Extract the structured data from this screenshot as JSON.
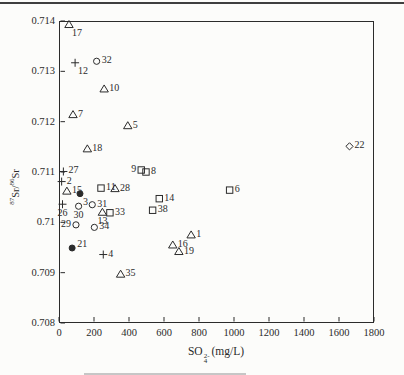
{
  "page": {
    "colors": {
      "ink": "#2b2b2b",
      "paper": "#fcfcfa",
      "top_rule": "#3f3f3f",
      "caption_fragment": "#c6c6c6"
    }
  },
  "chart_data": {
    "type": "scatter",
    "title": "",
    "xlabel_parts": {
      "base": "SO",
      "sup": "2-",
      "sub": "4",
      "suffix": "(mg/L)"
    },
    "ylabel_parts": {
      "sup1": "87",
      "base1": "Sr/",
      "sup2": "86",
      "base2": "Sr"
    },
    "xlim": [
      0,
      1800
    ],
    "ylim": [
      0.708,
      0.714
    ],
    "grid": false,
    "legend": "none",
    "tick_style": "inside",
    "x_ticks": [
      {
        "value": 0,
        "label": "0"
      },
      {
        "value": 200,
        "label": "200"
      },
      {
        "value": 400,
        "label": "400"
      },
      {
        "value": 600,
        "label": "600"
      },
      {
        "value": 800,
        "label": "800"
      },
      {
        "value": 1000,
        "label": "1000"
      },
      {
        "value": 1200,
        "label": "1200"
      },
      {
        "value": 1400,
        "label": "1400"
      },
      {
        "value": 1600,
        "label": "1600"
      },
      {
        "value": 1800,
        "label": "1800"
      }
    ],
    "y_ticks": [
      {
        "value": 0.714,
        "label": "0.714"
      },
      {
        "value": 0.713,
        "label": "0.713"
      },
      {
        "value": 0.712,
        "label": "0.712"
      },
      {
        "value": 0.711,
        "label": "0.711"
      },
      {
        "value": 0.71,
        "label": "0.71"
      },
      {
        "value": 0.709,
        "label": "0.709"
      },
      {
        "value": 0.708,
        "label": "0.708"
      }
    ],
    "series": [
      {
        "name": "samples",
        "points": [
          {
            "id": "17",
            "marker": "triangle",
            "x": 57,
            "y": 0.71393,
            "label_pos": "below-right"
          },
          {
            "id": "12",
            "marker": "plus",
            "x": 92,
            "y": 0.71317,
            "label_pos": "below-right"
          },
          {
            "id": "32",
            "marker": "circle",
            "x": 215,
            "y": 0.7132,
            "label_pos": "right"
          },
          {
            "id": "10",
            "marker": "triangle",
            "x": 258,
            "y": 0.71265,
            "label_pos": "right"
          },
          {
            "id": "7",
            "marker": "triangle",
            "x": 80,
            "y": 0.71214,
            "label_pos": "right"
          },
          {
            "id": "5",
            "marker": "triangle",
            "x": 393,
            "y": 0.71192,
            "label_pos": "right"
          },
          {
            "id": "18",
            "marker": "triangle",
            "x": 162,
            "y": 0.71146,
            "label_pos": "right"
          },
          {
            "id": "22",
            "marker": "diamond",
            "x": 1660,
            "y": 0.71151,
            "label_pos": "right"
          },
          {
            "id": "9",
            "marker": "square",
            "x": 470,
            "y": 0.71104,
            "label_pos": "left"
          },
          {
            "id": "8",
            "marker": "square",
            "x": 497,
            "y": 0.711,
            "label_pos": "right"
          },
          {
            "id": "27",
            "marker": "plus",
            "x": 25,
            "y": 0.71101,
            "label_pos": "right"
          },
          {
            "id": "2",
            "marker": "plus",
            "x": 15,
            "y": 0.71081,
            "label_pos": "right"
          },
          {
            "id": "15",
            "marker": "triangle",
            "x": 45,
            "y": 0.71062,
            "label_pos": "right"
          },
          {
            "id": "3",
            "marker": "filled-circle",
            "x": 120,
            "y": 0.71057,
            "label_pos": "below-right"
          },
          {
            "id": "11",
            "marker": "square",
            "x": 240,
            "y": 0.71068,
            "label_pos": "right"
          },
          {
            "id": "28",
            "marker": "triangle",
            "x": 320,
            "y": 0.71067,
            "label_pos": "right"
          },
          {
            "id": "14",
            "marker": "square",
            "x": 573,
            "y": 0.71047,
            "label_pos": "right"
          },
          {
            "id": "6",
            "marker": "square",
            "x": 975,
            "y": 0.71064,
            "label_pos": "right"
          },
          {
            "id": "26",
            "marker": "plus",
            "x": 20,
            "y": 0.71036,
            "label_pos": "below"
          },
          {
            "id": "30",
            "marker": "circle",
            "x": 112,
            "y": 0.71032,
            "label_pos": "below"
          },
          {
            "id": "31",
            "marker": "circle",
            "x": 190,
            "y": 0.71035,
            "label_pos": "right"
          },
          {
            "id": "13",
            "marker": "triangle",
            "x": 248,
            "y": 0.7102,
            "label_pos": "below"
          },
          {
            "id": "33",
            "marker": "square",
            "x": 291,
            "y": 0.71019,
            "label_pos": "right"
          },
          {
            "id": "38",
            "marker": "square",
            "x": 535,
            "y": 0.71024,
            "label_pos": "right"
          },
          {
            "id": "29",
            "marker": "circle",
            "x": 97,
            "y": 0.70995,
            "label_pos": "left"
          },
          {
            "id": "34",
            "marker": "circle",
            "x": 202,
            "y": 0.7099,
            "label_pos": "right"
          },
          {
            "id": "1",
            "marker": "triangle",
            "x": 755,
            "y": 0.70975,
            "label_pos": "right"
          },
          {
            "id": "16",
            "marker": "triangle",
            "x": 650,
            "y": 0.70955,
            "label_pos": "right"
          },
          {
            "id": "19",
            "marker": "triangle",
            "x": 685,
            "y": 0.70942,
            "label_pos": "right"
          },
          {
            "id": "21",
            "marker": "filled-circle",
            "x": 75,
            "y": 0.70949,
            "label_pos": "right-up"
          },
          {
            "id": "4",
            "marker": "plus",
            "x": 253,
            "y": 0.70936,
            "label_pos": "right"
          },
          {
            "id": "35",
            "marker": "triangle",
            "x": 352,
            "y": 0.70897,
            "label_pos": "right"
          }
        ]
      }
    ]
  }
}
